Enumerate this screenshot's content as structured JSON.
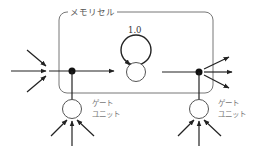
{
  "diagram": {
    "memory_cell": {
      "label": "メモリセル"
    },
    "self_loop": {
      "weight": "1.0"
    },
    "gates": [
      {
        "id": "input-gate",
        "label_line1": "ゲート",
        "label_line2": "ユニット"
      },
      {
        "id": "output-gate",
        "label_line1": "ゲート",
        "label_line2": "ユニット"
      }
    ],
    "colors": {
      "stroke": "#222222",
      "box": "#777777",
      "node_fill": "#ffffff"
    }
  }
}
